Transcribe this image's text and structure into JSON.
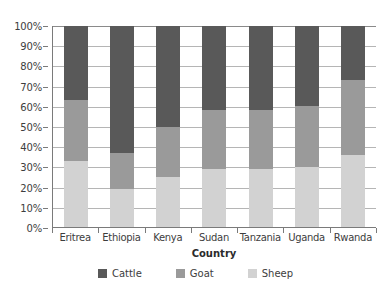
{
  "chart_data": {
    "type": "bar",
    "subtype": "100% stacked bar",
    "title": "",
    "xlabel": "Country",
    "ylabel": "",
    "categories": [
      "Eritrea",
      "Ethiopia",
      "Kenya",
      "Sudan",
      "Tanzania",
      "Uganda",
      "Rwanda"
    ],
    "series": [
      {
        "name": "Sheep",
        "color": "#d2d2d2",
        "values": [
          33,
          19,
          25,
          29,
          29,
          30,
          36
        ]
      },
      {
        "name": "Goat",
        "color": "#9a9a9a",
        "values": [
          30,
          18,
          25,
          29,
          29,
          30,
          37
        ]
      },
      {
        "name": "Cattle",
        "color": "#595959",
        "values": [
          37,
          63,
          50,
          42,
          42,
          40,
          27
        ]
      }
    ],
    "stack_order_bottom_to_top": [
      "Sheep",
      "Goat",
      "Cattle"
    ],
    "cumulative_boundaries_percent": {
      "Eritrea": {
        "sheep_top": 33,
        "goat_top": 63
      },
      "Ethiopia": {
        "sheep_top": 19,
        "goat_top": 37
      },
      "Kenya": {
        "sheep_top": 25,
        "goat_top": 50
      },
      "Sudan": {
        "sheep_top": 29,
        "goat_top": 58
      },
      "Tanzania": {
        "sheep_top": 29,
        "goat_top": 58
      },
      "Uganda": {
        "sheep_top": 30,
        "goat_top": 60
      },
      "Rwanda": {
        "sheep_top": 36,
        "goat_top": 73
      }
    },
    "ylim": [
      0,
      100
    ],
    "y_tick_labels": [
      "100%",
      "90%",
      "80%",
      "70%",
      "60%",
      "50%",
      "40%",
      "30%",
      "20%",
      "10%",
      "0%"
    ],
    "y_tick_values": [
      100,
      90,
      80,
      70,
      60,
      50,
      40,
      30,
      20,
      10,
      0
    ],
    "grid": true,
    "legend_position": "bottom",
    "legend_entries": [
      "Cattle",
      "Goat",
      "Sheep"
    ]
  },
  "axis": {
    "x_title": "Country"
  },
  "legend": {
    "items": [
      {
        "label": "Cattle",
        "color": "#595959"
      },
      {
        "label": "Goat",
        "color": "#9a9a9a"
      },
      {
        "label": "Sheep",
        "color": "#d2d2d2"
      }
    ]
  }
}
